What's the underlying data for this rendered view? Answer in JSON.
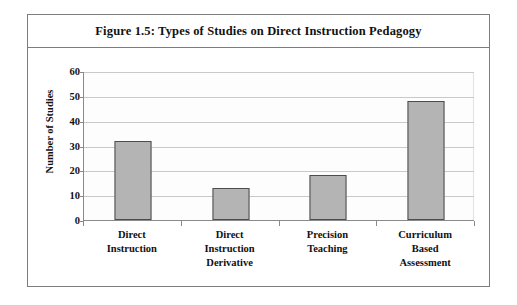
{
  "figure": {
    "title": "Figure 1.5: Types of Studies on Direct Instruction Pedagogy",
    "frame_color": "#7d7d7d"
  },
  "chart_data": {
    "type": "bar",
    "title": "Figure 1.5: Types of Studies on Direct Instruction Pedagogy",
    "categories": [
      "Direct Instruction",
      "Direct Instruction Derivative",
      "Precision Teaching",
      "Curriculum Based Assessment"
    ],
    "category_lines": [
      [
        "Direct",
        "Instruction"
      ],
      [
        "Direct",
        "Instruction",
        "Derivative"
      ],
      [
        "Precision",
        "Teaching"
      ],
      [
        "Curriculum",
        "Based",
        "Assessment"
      ]
    ],
    "values": [
      32,
      13,
      18,
      48
    ],
    "xlabel": "",
    "ylabel": "Number of Studies",
    "ylim": [
      0,
      60
    ],
    "ytick_values": [
      0,
      10,
      20,
      30,
      40,
      50,
      60
    ],
    "ytick_labels": [
      "0",
      "10",
      "20",
      "30",
      "40",
      "50",
      "60"
    ],
    "grid": true,
    "grid_axis": "y",
    "legend": false,
    "bar_fill_color": "#b4b4b4",
    "bar_border_color": "#4d4d4d",
    "gridline_color": "#c9c9c9",
    "axis_color": "#8a8a8a",
    "plot_background": "#fdfdfd"
  }
}
